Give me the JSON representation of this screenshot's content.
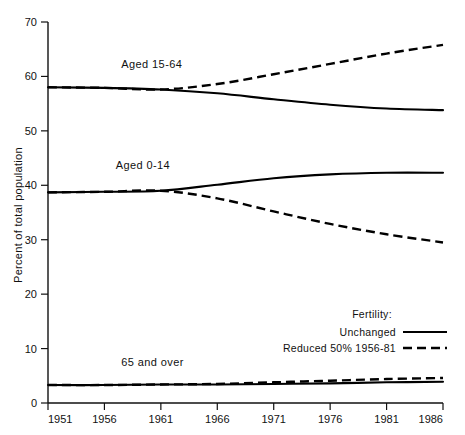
{
  "chart_data": {
    "type": "line",
    "title": "",
    "xlabel": "",
    "ylabel": "Percent of total population",
    "xlim": [
      1951,
      1986
    ],
    "ylim": [
      0,
      70
    ],
    "grid": false,
    "x_ticks": [
      "1951",
      "1956",
      "1961",
      "1966",
      "1971",
      "1976",
      "1981",
      "1986"
    ],
    "y_ticks": [
      "0",
      "10",
      "20",
      "30",
      "40",
      "50",
      "60",
      "70"
    ],
    "x": [
      1951,
      1956,
      1961,
      1966,
      1971,
      1976,
      1981,
      1986
    ],
    "branch_year": 1961,
    "legend": {
      "title": "Fertility:",
      "entries": [
        {
          "label": "Unchanged",
          "style": "solid"
        },
        {
          "label": "Reduced 50% 1956-81",
          "style": "dashed"
        }
      ],
      "position": "inside-lower-right"
    },
    "annotations": [
      {
        "text": "Aged 15-64",
        "x": 1957.5,
        "y": 61.5
      },
      {
        "text": "Aged 0-14",
        "x": 1957.0,
        "y": 43.0
      },
      {
        "text": "65 and over",
        "x": 1957.5,
        "y": 6.8
      }
    ],
    "series": [
      {
        "name": "Aged 15-64 Unchanged",
        "group": "Aged 15-64",
        "style": "solid",
        "values": [
          58.0,
          57.9,
          57.6,
          56.9,
          55.8,
          54.8,
          54.1,
          53.8
        ]
      },
      {
        "name": "Aged 15-64 Reduced 50% 1956-81",
        "group": "Aged 15-64",
        "style": "dashed",
        "values": [
          58.0,
          57.9,
          57.6,
          58.6,
          60.4,
          62.3,
          64.2,
          65.8
        ]
      },
      {
        "name": "Aged 0-14 Unchanged",
        "group": "Aged 0-14",
        "style": "solid",
        "values": [
          38.7,
          38.8,
          39.0,
          40.1,
          41.3,
          42.0,
          42.3,
          42.3
        ]
      },
      {
        "name": "Aged 0-14 Reduced 50% 1956-81",
        "group": "Aged 0-14",
        "style": "dashed",
        "values": [
          38.7,
          38.8,
          39.0,
          37.6,
          35.2,
          32.9,
          31.0,
          29.5
        ]
      },
      {
        "name": "65 and over Unchanged",
        "group": "65 and over",
        "style": "solid",
        "values": [
          3.3,
          3.3,
          3.4,
          3.4,
          3.5,
          3.6,
          3.8,
          3.9
        ]
      },
      {
        "name": "65 and over Reduced 50% 1956-81",
        "group": "65 and over",
        "style": "dashed",
        "values": [
          3.3,
          3.3,
          3.4,
          3.5,
          3.8,
          4.1,
          4.4,
          4.6
        ]
      }
    ]
  }
}
